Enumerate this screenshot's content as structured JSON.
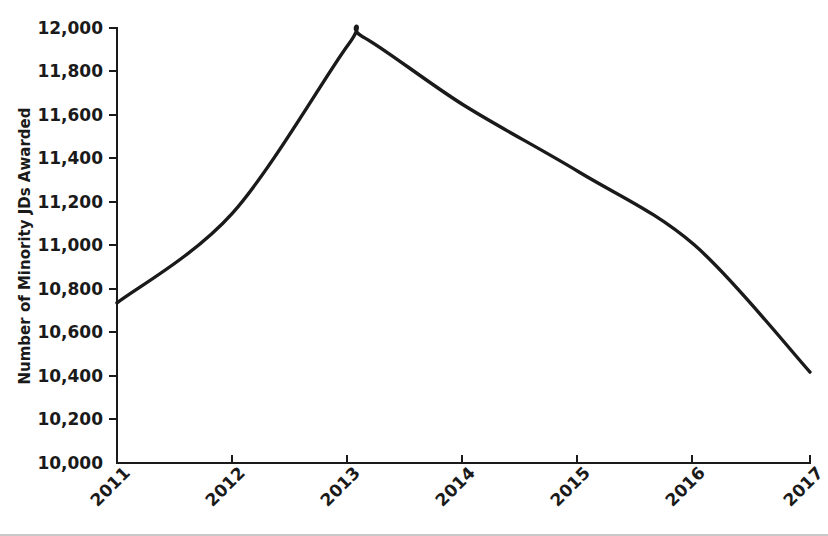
{
  "chart_data": {
    "type": "line",
    "title": "",
    "subtitle": "",
    "xlabel": "",
    "ylabel": "Number of Minority JDs Awarded",
    "categories": [
      "2011",
      "2012",
      "2013",
      "2014",
      "2015",
      "2016",
      "2017"
    ],
    "x": [
      2011,
      2012,
      2013,
      2014,
      2015,
      2016,
      2017
    ],
    "values": [
      10736,
      11149,
      11922,
      11646,
      11338,
      11002,
      10418
    ],
    "series": [
      {
        "name": "Number of Minority JDs Awarded",
        "values": [
          10736,
          11149,
          11922,
          11646,
          11338,
          11002,
          10418
        ],
        "color": "#1a1a1a"
      }
    ],
    "peak": {
      "x": 2013.13,
      "y": 11959
    },
    "xlim": [
      2011,
      2017
    ],
    "ylim": [
      10000,
      12000
    ],
    "ytick_values": [
      10000,
      10200,
      10400,
      10600,
      10800,
      11000,
      11200,
      11400,
      11600,
      11800,
      12000
    ],
    "ytick_labels": [
      "10,000",
      "10,200",
      "10,400",
      "10,600",
      "10,800",
      "11,000",
      "11,200",
      "11,400",
      "11,600",
      "11,800",
      "12,000"
    ],
    "xtick_labels": [
      "2011",
      "2012",
      "2013",
      "2014",
      "2015",
      "2016",
      "2017"
    ],
    "xtick_rotation_deg": -45,
    "grid": false,
    "legend": false,
    "legend_position": "none",
    "line_color": "#1a1a1a",
    "background_color": "#ffffff",
    "axis_color": "#1a1a1a",
    "spines": [
      "left",
      "bottom"
    ]
  },
  "axis": {
    "y_title": "Number of Minority JDs Awarded"
  },
  "ytick_labels": {
    "t0": "10,000",
    "t1": "10,200",
    "t2": "10,400",
    "t3": "10,600",
    "t4": "10,800",
    "t5": "11,000",
    "t6": "11,200",
    "t7": "11,400",
    "t8": "11,600",
    "t9": "11,800",
    "t10": "12,000"
  },
  "xtick_labels": {
    "t0": "2011",
    "t1": "2012",
    "t2": "2013",
    "t3": "2014",
    "t4": "2015",
    "t5": "2016",
    "t6": "2017"
  }
}
